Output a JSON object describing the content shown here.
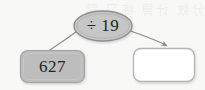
{
  "diagram": {
    "type": "function-machine",
    "background_color": "#f8f8f7",
    "watermark_text": "分数 计算 练习 题",
    "operator_node": {
      "shape": "ellipse",
      "text": "÷ 19",
      "operation": "divide",
      "operand": "19",
      "fill_color": "#c6c6c6",
      "stroke_color": "#8e8e8e",
      "text_color": "#232323"
    },
    "input_node": {
      "shape": "rounded-rectangle",
      "text": "627",
      "value": "627",
      "fill_color": "#bdbdbd",
      "stroke_color": "#a2a2a2",
      "text_color": "#232323"
    },
    "output_node": {
      "shape": "rounded-rectangle",
      "text": "",
      "value": "",
      "placeholder": "",
      "fill_color": "#ffffff",
      "stroke_color": "#b4b4b4",
      "text_color": "#232323"
    },
    "connectors": [
      {
        "name": "input-to-operator",
        "from": "input_node",
        "to": "operator_node",
        "style": "curved-line",
        "arrowhead": false,
        "stroke_color": "#8a8a8a"
      },
      {
        "name": "operator-to-output",
        "from": "operator_node",
        "to": "output_node",
        "style": "curved-arrow",
        "arrowhead": true,
        "stroke_color": "#8a8a8a"
      }
    ]
  }
}
